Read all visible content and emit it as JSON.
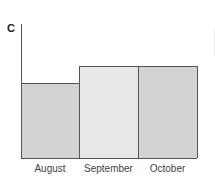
{
  "chart_data": {
    "type": "bar",
    "title": "",
    "panel_label": "C",
    "xlabel": "",
    "ylabel": "",
    "categories": [
      "August",
      "September",
      "October"
    ],
    "values": [
      56,
      69,
      69
    ],
    "ylim": [
      0,
      100
    ],
    "grid": false,
    "legend": null,
    "bar_colors": [
      "#d3d3d3",
      "#e8e8e8",
      "#d3d3d3"
    ],
    "border_color": "#555555",
    "note": "No y-axis ticks shown; values are relative heights as % of axis height"
  }
}
